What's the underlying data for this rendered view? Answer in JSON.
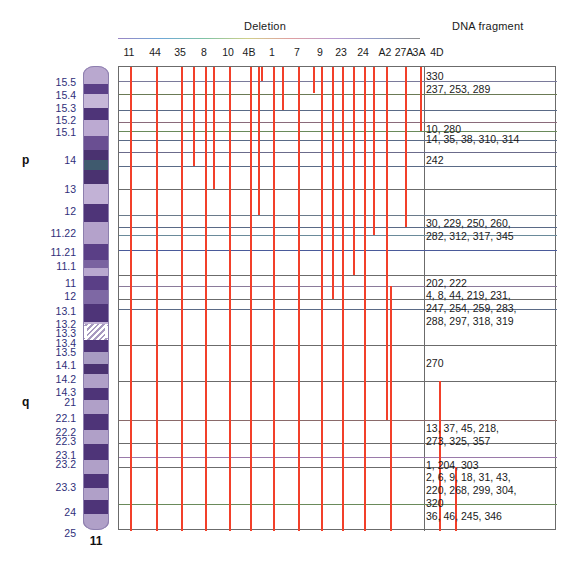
{
  "header": {
    "deletion_title": "Deletion",
    "dna_fragment_title": "DNA fragment"
  },
  "chromosome": {
    "name": "11",
    "arms": [
      {
        "label": "p",
        "y": 160
      },
      {
        "label": "q",
        "y": 402
      }
    ],
    "band_labels": [
      {
        "label": "15.5",
        "y": 82
      },
      {
        "label": "15.4",
        "y": 95
      },
      {
        "label": "15.3",
        "y": 108
      },
      {
        "label": "15.2",
        "y": 120
      },
      {
        "label": "15.1",
        "y": 132
      },
      {
        "label": "14",
        "y": 160
      },
      {
        "label": "13",
        "y": 189
      },
      {
        "label": "12",
        "y": 211
      },
      {
        "label": "11.22",
        "y": 233
      },
      {
        "label": "11.21",
        "y": 252
      },
      {
        "label": "11.1",
        "y": 266
      },
      {
        "label": "11",
        "y": 283
      },
      {
        "label": "12",
        "y": 296
      },
      {
        "label": "13.1",
        "y": 311
      },
      {
        "label": "13.2",
        "y": 324
      },
      {
        "label": "13.3",
        "y": 333
      },
      {
        "label": "13.4",
        "y": 343
      },
      {
        "label": "13.5",
        "y": 352
      },
      {
        "label": "14.1",
        "y": 365
      },
      {
        "label": "14.2",
        "y": 379
      },
      {
        "label": "14.3",
        "y": 392
      },
      {
        "label": "21",
        "y": 402
      },
      {
        "label": "22.1",
        "y": 418
      },
      {
        "label": "22.2",
        "y": 432
      },
      {
        "label": "22.3",
        "y": 441
      },
      {
        "label": "23.1",
        "y": 455
      },
      {
        "label": "23.2",
        "y": 464
      },
      {
        "label": "23.3",
        "y": 487
      },
      {
        "label": "24",
        "y": 512
      },
      {
        "label": "25",
        "y": 533
      }
    ],
    "bands": [
      {
        "top": 0,
        "h": 18,
        "color": "#b9a8cf"
      },
      {
        "top": 18,
        "h": 10,
        "color": "#5a3f86"
      },
      {
        "top": 28,
        "h": 14,
        "color": "#c6b7d8"
      },
      {
        "top": 42,
        "h": 12,
        "color": "#4e3478"
      },
      {
        "top": 54,
        "h": 16,
        "color": "#bcaad2"
      },
      {
        "top": 70,
        "h": 14,
        "color": "#6a4f92"
      },
      {
        "top": 84,
        "h": 10,
        "color": "#4a3270"
      },
      {
        "top": 94,
        "h": 10,
        "color": "#3f5a6e"
      },
      {
        "top": 104,
        "h": 14,
        "color": "#4a3270"
      },
      {
        "top": 118,
        "h": 20,
        "color": "#c2b2d6"
      },
      {
        "top": 138,
        "h": 18,
        "color": "#4e3478"
      },
      {
        "top": 156,
        "h": 22,
        "color": "#b4a2cb"
      },
      {
        "top": 178,
        "h": 16,
        "color": "#5a3f86"
      },
      {
        "top": 194,
        "h": 8,
        "color": "#7a63a0"
      },
      {
        "top": 210,
        "h": 14,
        "color": "#5a3f86"
      },
      {
        "top": 224,
        "h": 14,
        "color": "#7e68a4"
      },
      {
        "top": 238,
        "h": 18,
        "color": "#4e3478"
      },
      {
        "top": 256,
        "h": 14,
        "color": "#c2b2d6"
      },
      {
        "top": 270,
        "h": 16,
        "color": "#4e3478"
      },
      {
        "top": 286,
        "h": 12,
        "color": "#a89cc2"
      },
      {
        "top": 298,
        "h": 10,
        "color": "#4a3270"
      },
      {
        "top": 308,
        "h": 14,
        "color": "#b0a0c8"
      },
      {
        "top": 322,
        "h": 12,
        "color": "#4e3478"
      },
      {
        "top": 334,
        "h": 14,
        "color": "#b0a0c8"
      },
      {
        "top": 348,
        "h": 16,
        "color": "#4e3478"
      },
      {
        "top": 364,
        "h": 14,
        "color": "#b0a0c8"
      },
      {
        "top": 378,
        "h": 16,
        "color": "#4e3478"
      },
      {
        "top": 394,
        "h": 14,
        "color": "#b0a0c8"
      },
      {
        "top": 408,
        "h": 14,
        "color": "#4e3478"
      },
      {
        "top": 422,
        "h": 12,
        "color": "#b0a0c8"
      },
      {
        "top": 434,
        "h": 14,
        "color": "#4e3478"
      },
      {
        "top": 448,
        "h": 58,
        "color": "#b0a0c8"
      },
      {
        "top": 506,
        "h": 18,
        "color": "#4e3478"
      },
      {
        "top": 524,
        "h": 40,
        "color": "#b0a0c8"
      }
    ],
    "centromere": {
      "top": 258,
      "h": 16
    }
  },
  "grid": {
    "columns": [
      {
        "label": "11",
        "x": 129
      },
      {
        "label": "44",
        "x": 155
      },
      {
        "label": "35",
        "x": 180
      },
      {
        "label": "8",
        "x": 204
      },
      {
        "label": "10",
        "x": 228
      },
      {
        "label": "4B",
        "x": 249
      },
      {
        "label": "1",
        "x": 272
      },
      {
        "label": "7",
        "x": 297
      },
      {
        "label": "9",
        "x": 320
      },
      {
        "label": "23",
        "x": 341
      },
      {
        "label": "24",
        "x": 363
      },
      {
        "label": "A2",
        "x": 385
      },
      {
        "label": "27A",
        "x": 404
      },
      {
        "label": "3A",
        "x": 419
      },
      {
        "label": "4D",
        "x": 437
      }
    ],
    "deletion_bars": [
      {
        "name": "11",
        "x": 129,
        "top": 0,
        "bottom": 464
      },
      {
        "name": "44",
        "x": 155,
        "top": 0,
        "bottom": 464
      },
      {
        "name": "35",
        "x": 180,
        "top": 0,
        "bottom": 464
      },
      {
        "name": "8",
        "x": 204,
        "top": 0,
        "bottom": 464
      },
      {
        "name": "10",
        "x": 228,
        "top": 0,
        "bottom": 464
      },
      {
        "name": "4B",
        "x": 249,
        "top": 0,
        "bottom": 464
      },
      {
        "name": "1",
        "x": 272,
        "top": 0,
        "bottom": 464
      },
      {
        "name": "7",
        "x": 297,
        "top": 0,
        "bottom": 464
      },
      {
        "name": "9",
        "x": 320,
        "top": 0,
        "bottom": 464
      },
      {
        "name": "23",
        "x": 341,
        "top": 0,
        "bottom": 464
      },
      {
        "name": "24",
        "x": 363,
        "top": 0,
        "bottom": 464
      },
      {
        "name": "A2",
        "x": 385,
        "top": 0,
        "bottom": 353
      },
      {
        "name": "27A",
        "x": 404,
        "top": 0,
        "bottom": 160
      },
      {
        "name": "3A",
        "x": 419,
        "top": 0,
        "bottom": 64
      },
      {
        "name": "short-10b",
        "x": 228,
        "top": 0,
        "bottom": 27
      },
      {
        "name": "short-4Bb",
        "x": 260,
        "top": 0,
        "bottom": 14
      },
      {
        "name": "short-1b",
        "x": 281,
        "top": 0,
        "bottom": 43
      },
      {
        "name": "short-7b",
        "x": 312,
        "top": 0,
        "bottom": 26
      },
      {
        "name": "short-35b",
        "x": 192,
        "top": 0,
        "bottom": 99
      },
      {
        "name": "mid-8b",
        "x": 212,
        "top": 0,
        "bottom": 122
      },
      {
        "name": "long-9b",
        "x": 331,
        "top": 0,
        "bottom": 232
      },
      {
        "name": "long-23b",
        "x": 352,
        "top": 0,
        "bottom": 208
      },
      {
        "name": "long-24b",
        "x": 372,
        "top": 0,
        "bottom": 168
      },
      {
        "name": "mid-4Bc",
        "x": 257,
        "top": 0,
        "bottom": 148
      },
      {
        "name": "q-270",
        "x": 389,
        "top": 219,
        "bottom": 464
      },
      {
        "name": "q-right",
        "x": 438,
        "top": 314,
        "bottom": 464
      },
      {
        "name": "q-far",
        "x": 454,
        "top": 400,
        "bottom": 464
      }
    ],
    "row_lines": [
      {
        "y": 14,
        "color": "#7a7a9a"
      },
      {
        "y": 27,
        "color": "#6b7a55"
      },
      {
        "y": 43,
        "color": "#5a6a86"
      },
      {
        "y": 55,
        "color": "#8a6a7a"
      },
      {
        "y": 64,
        "color": "#6a8a5a"
      },
      {
        "y": 73,
        "color": "#5a6a86"
      },
      {
        "y": 85,
        "color": "#6b6b8b"
      },
      {
        "y": 99,
        "color": "#5a6a86"
      },
      {
        "y": 122,
        "color": "#6b6b6b"
      },
      {
        "y": 148,
        "color": "#6a7a8a"
      },
      {
        "y": 160,
        "color": "#5a6a86"
      },
      {
        "y": 168,
        "color": "#6a8a9a"
      },
      {
        "y": 183,
        "color": "#4a5a9a"
      },
      {
        "y": 208,
        "color": "#6b6b6b"
      },
      {
        "y": 219,
        "color": "#8a7a9a"
      },
      {
        "y": 232,
        "color": "#6b6b6b"
      },
      {
        "y": 242,
        "color": "#5a6a86"
      },
      {
        "y": 278,
        "color": "#6b6b6b"
      },
      {
        "y": 314,
        "color": "#6b6b6b"
      },
      {
        "y": 353,
        "color": "#8a6a6a"
      },
      {
        "y": 376,
        "color": "#6b6b6b"
      },
      {
        "y": 390,
        "color": "#9a7aaa"
      },
      {
        "y": 400,
        "color": "#6b6b6b"
      },
      {
        "y": 437,
        "color": "#6a8a5a"
      }
    ],
    "fragment_labels": [
      {
        "text": "330",
        "y": 3
      },
      {
        "text": "237, 253, 289",
        "y": 16
      },
      {
        "text": "10, 280",
        "y": 56
      },
      {
        "text": "14, 35, 38, 310, 314",
        "y": 66
      },
      {
        "text": "242",
        "y": 87
      },
      {
        "text": "30, 229, 250, 260,\n282, 312, 317, 345",
        "y": 150
      },
      {
        "text": "202, 222",
        "y": 210
      },
      {
        "text": "4, 8, 44, 219, 231,\n247, 254, 259, 283,\n288, 297, 318, 319",
        "y": 222
      },
      {
        "text": "270",
        "y": 290
      },
      {
        "text": "13, 37, 45, 218,\n273, 325, 357",
        "y": 355
      },
      {
        "text": "1, 204, 303",
        "y": 392
      },
      {
        "text": "2, 6, 9, 18, 31, 43,\n220, 268, 299, 304,\n320",
        "y": 404
      },
      {
        "text": "36, 46, 245, 346",
        "y": 443
      }
    ]
  }
}
